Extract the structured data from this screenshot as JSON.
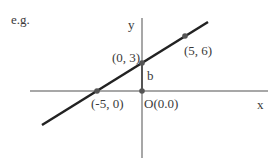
{
  "caption": "e.g.",
  "axes": {
    "x_label": "x",
    "y_label": "y",
    "origin_label": "O(0.0)"
  },
  "intercept_label": "b",
  "points": [
    {
      "label": "(0, 3)",
      "x": 0,
      "y": 3
    },
    {
      "label": "(5, 6)",
      "x": 5,
      "y": 6
    },
    {
      "label": "(-5, 0)",
      "x": -5,
      "y": 0
    }
  ],
  "colors": {
    "axis": "#8a8a8a",
    "line": "#222222",
    "point": "#555555",
    "text": "#3a3a3a"
  }
}
